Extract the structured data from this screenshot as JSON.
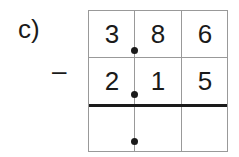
{
  "problem": {
    "label": "c)",
    "operator": "–",
    "row1": [
      "3",
      "8",
      "6"
    ],
    "row2": [
      "2",
      "1",
      "5"
    ],
    "result": [
      "",
      "",
      ""
    ]
  }
}
